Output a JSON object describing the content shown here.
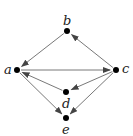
{
  "diagram": {
    "type": "directed-graph",
    "nodes": [
      {
        "id": "a",
        "label": "a",
        "x": 17,
        "y": 70,
        "lx": 4,
        "ly": 63
      },
      {
        "id": "b",
        "label": "b",
        "x": 67,
        "y": 31,
        "lx": 63,
        "ly": 14
      },
      {
        "id": "c",
        "label": "c",
        "x": 116,
        "y": 70,
        "lx": 122,
        "ly": 62
      },
      {
        "id": "d",
        "label": "d",
        "x": 66,
        "y": 92,
        "lx": 62,
        "ly": 97
      },
      {
        "id": "e",
        "label": "e",
        "x": 66,
        "y": 118,
        "lx": 62,
        "ly": 123
      }
    ],
    "edges": [
      {
        "from": "b",
        "to": "a"
      },
      {
        "from": "c",
        "to": "b"
      },
      {
        "from": "a",
        "to": "c"
      },
      {
        "from": "c",
        "to": "d"
      },
      {
        "from": "d",
        "to": "a"
      },
      {
        "from": "a",
        "to": "e"
      },
      {
        "from": "c",
        "to": "e"
      }
    ],
    "colors": {
      "edge": "#555555",
      "node": "#000000",
      "label": "#222222"
    }
  }
}
